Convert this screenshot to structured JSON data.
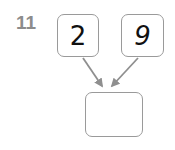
{
  "worksheet": {
    "problem_number": "11",
    "background_color": "#ffffff",
    "stroke_color": "#9a9a9a",
    "label_color": "#8c8c8c",
    "digit_color": "#111111"
  },
  "diagram": {
    "type": "number-bond-addition",
    "nodes": [
      {
        "id": "addend-left",
        "value": "2",
        "filled": true,
        "style": "upright"
      },
      {
        "id": "addend-right",
        "value": "9",
        "filled": true,
        "style": "slanted"
      },
      {
        "id": "sum",
        "value": "",
        "filled": false,
        "style": "upright"
      }
    ],
    "arrows": [
      {
        "from": "addend-left",
        "to": "sum"
      },
      {
        "from": "addend-right",
        "to": "sum"
      }
    ]
  }
}
